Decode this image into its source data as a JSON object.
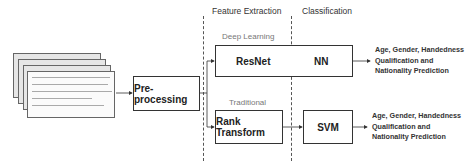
{
  "diagram": {
    "sections": {
      "feature_extraction": "Feature Extraction",
      "classification": "Classification"
    },
    "branches": {
      "deep_learning": "Deep Learning",
      "traditional": "Traditional"
    },
    "input": {
      "description": "stack of handwritten document images",
      "pages": 4
    },
    "nodes": {
      "preprocessing": "Pre-processing",
      "resnet": "ResNet",
      "nn": "NN",
      "rank_transform": "Rank Transform",
      "svm": "SVM"
    },
    "outputs": {
      "deep": {
        "line1": "Age, Gender, Handedness",
        "line2": "Qualification and",
        "line3": "Nationality Prediction"
      },
      "traditional": {
        "line1": "Age, Gender, Handedness",
        "line2": "Qualification and",
        "line3": "Nationality Prediction"
      }
    },
    "edges": [
      [
        "input",
        "preprocessing"
      ],
      [
        "preprocessing",
        "resnet"
      ],
      [
        "preprocessing",
        "rank_transform"
      ],
      [
        "resnet",
        "nn"
      ],
      [
        "rank_transform",
        "svm"
      ],
      [
        "nn",
        "output_deep"
      ],
      [
        "svm",
        "output_traditional"
      ]
    ]
  }
}
